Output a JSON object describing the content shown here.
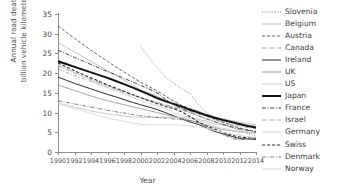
{
  "chart_data": {
    "type": "line",
    "title": "",
    "xlabel": "Year",
    "ylabel": "Annual road deaths per billion vehicle kilometers travelled",
    "ylabel_line1": "Annual road deaths per",
    "ylabel_line2": "billion vehicle kilometers travelled",
    "xlim": [
      1990,
      2014
    ],
    "ylim": [
      0,
      35
    ],
    "xticks": [
      1990,
      1992,
      1994,
      1996,
      1998,
      2000,
      2002,
      2004,
      2006,
      2008,
      2010,
      2012,
      2014
    ],
    "yticks": [
      0,
      5,
      10,
      15,
      20,
      25,
      30,
      35
    ],
    "grid": false,
    "legend_position": "right",
    "x": [
      1990,
      1991,
      1992,
      1993,
      1994,
      1995,
      1996,
      1997,
      1998,
      1999,
      2000,
      2001,
      2002,
      2003,
      2004,
      2005,
      2006,
      2007,
      2008,
      2009,
      2010,
      2011,
      2012,
      2013,
      2014
    ],
    "series": [
      {
        "name": "Slovenia",
        "style": "dotted",
        "width": 0.8,
        "color": "#6e6e6e",
        "x": [
          2000,
          2001,
          2002,
          2003,
          2004,
          2005,
          2006,
          2007,
          2008,
          2009,
          2010,
          2011,
          2012,
          2013,
          2014
        ],
        "values": [
          26.9,
          24.0,
          21.5,
          19.0,
          17.5,
          16.0,
          14.9,
          12.0,
          10.0,
          8.6,
          7.2,
          6.3,
          5.6,
          4.6,
          4.0
        ]
      },
      {
        "name": "Belgium",
        "style": "solid",
        "width": 0.8,
        "color": "#b5b5b5",
        "values": [
          27.8,
          26.6,
          25.4,
          24.2,
          23.0,
          21.8,
          20.6,
          19.4,
          18.2,
          17.0,
          15.8,
          15.0,
          14.2,
          13.0,
          12.0,
          11.5,
          11.0,
          10.4,
          9.6,
          8.8,
          8.4,
          8.0,
          7.6,
          7.2,
          7.0
        ]
      },
      {
        "name": "Austria",
        "style": "dashed",
        "width": 0.9,
        "color": "#4f4f4f",
        "values": [
          32.0,
          30.4,
          28.8,
          27.3,
          25.8,
          24.4,
          23.0,
          21.6,
          20.3,
          19.0,
          17.7,
          16.6,
          15.5,
          14.2,
          12.9,
          11.8,
          11.0,
          10.0,
          9.2,
          8.3,
          7.6,
          6.8,
          6.1,
          5.6,
          5.2
        ]
      },
      {
        "name": "Canada",
        "style": "dashdotted",
        "width": 0.8,
        "color": "#8a8a8a",
        "values": [
          21.8,
          20.9,
          20.0,
          19.2,
          18.4,
          17.6,
          16.8,
          16.0,
          15.3,
          14.5,
          13.8,
          13.2,
          12.6,
          12.0,
          11.4,
          10.9,
          10.3,
          9.7,
          9.0,
          8.2,
          7.6,
          7.0,
          6.6,
          6.2,
          5.9
        ]
      },
      {
        "name": "Ireland",
        "style": "solid",
        "width": 1.0,
        "color": "#2b2b2b",
        "values": [
          19.0,
          18.2,
          17.4,
          16.7,
          16.0,
          15.3,
          14.6,
          14.0,
          13.3,
          12.6,
          12.0,
          11.4,
          10.8,
          10.0,
          9.2,
          8.4,
          7.6,
          7.0,
          6.1,
          5.2,
          4.6,
          4.0,
          3.4,
          3.3,
          3.2
        ]
      },
      {
        "name": "UK",
        "style": "solid",
        "width": 0.8,
        "color": "#8f8f8f",
        "values": [
          17.0,
          16.3,
          15.6,
          14.9,
          14.2,
          13.6,
          13.0,
          12.5,
          12.0,
          11.5,
          11.0,
          10.5,
          10.0,
          9.5,
          9.0,
          8.5,
          8.0,
          7.5,
          6.9,
          6.2,
          5.7,
          5.4,
          5.1,
          4.9,
          4.8
        ]
      },
      {
        "name": "US",
        "style": "solid",
        "width": 0.9,
        "color": "#c4c4c4",
        "values": [
          12.4,
          11.9,
          11.4,
          10.9,
          10.4,
          10.0,
          9.7,
          9.4,
          9.1,
          8.9,
          8.8,
          8.8,
          8.8,
          8.8,
          8.8,
          8.8,
          8.6,
          8.3,
          7.8,
          7.1,
          6.9,
          6.8,
          6.9,
          6.8,
          6.8
        ]
      },
      {
        "name": "Japan",
        "style": "solid",
        "width": 2.0,
        "color": "#111111",
        "values": [
          23.0,
          22.3,
          21.6,
          20.9,
          20.2,
          19.5,
          18.8,
          18.0,
          17.2,
          16.4,
          15.5,
          14.6,
          13.7,
          12.9,
          12.2,
          11.5,
          10.7,
          10.0,
          9.3,
          8.7,
          8.1,
          7.6,
          7.1,
          6.6,
          6.2
        ]
      },
      {
        "name": "France",
        "style": "dashdotted",
        "width": 1.0,
        "color": "#3f3f3f",
        "values": [
          25.8,
          24.9,
          24.0,
          23.1,
          22.2,
          21.3,
          20.4,
          19.6,
          18.7,
          17.8,
          16.9,
          16.0,
          15.0,
          13.4,
          12.0,
          11.0,
          10.0,
          9.2,
          8.4,
          7.7,
          7.0,
          6.4,
          5.9,
          5.5,
          5.2
        ]
      },
      {
        "name": "Israel",
        "style": "dashdotted",
        "width": 0.8,
        "color": "#9a9a9a",
        "values": [
          21.0,
          20.2,
          19.4,
          18.6,
          17.9,
          17.1,
          16.4,
          15.7,
          15.0,
          14.4,
          13.8,
          13.1,
          12.5,
          11.9,
          11.2,
          10.6,
          10.0,
          9.2,
          8.4,
          7.6,
          6.9,
          6.2,
          5.6,
          5.2,
          4.9
        ]
      },
      {
        "name": "Germany",
        "style": "solid",
        "width": 0.8,
        "color": "#cdcdcd",
        "values": [
          22.2,
          21.2,
          20.2,
          19.2,
          18.2,
          17.3,
          16.4,
          15.5,
          14.7,
          13.9,
          13.1,
          12.4,
          11.7,
          11.0,
          10.0,
          9.3,
          8.7,
          8.1,
          7.4,
          6.6,
          6.0,
          5.6,
          5.2,
          4.9,
          4.6
        ]
      },
      {
        "name": "Swiss",
        "style": "dashed",
        "width": 1.1,
        "color": "#2f2f2f",
        "values": [
          22.6,
          21.6,
          20.6,
          19.7,
          18.8,
          17.9,
          17.0,
          16.2,
          15.4,
          14.6,
          13.8,
          13.0,
          12.3,
          11.6,
          11.0,
          10.2,
          9.0,
          7.6,
          6.6,
          5.8,
          5.0,
          4.3,
          3.8,
          3.6,
          3.5
        ]
      },
      {
        "name": "Denmark",
        "style": "dashdotted",
        "width": 0.9,
        "color": "#707070",
        "values": [
          13.0,
          12.6,
          12.2,
          11.8,
          11.4,
          11.0,
          10.6,
          10.2,
          9.9,
          9.5,
          9.2,
          9.0,
          8.8,
          8.6,
          8.4,
          8.2,
          8.0,
          7.4,
          6.4,
          5.4,
          4.4,
          3.6,
          3.0,
          3.4,
          3.8
        ]
      },
      {
        "name": "Norway",
        "style": "solid",
        "width": 0.9,
        "color": "#d8d8d8",
        "values": [
          12.2,
          11.6,
          11.0,
          10.4,
          9.8,
          9.2,
          8.6,
          8.2,
          7.8,
          7.4,
          7.0,
          6.9,
          6.9,
          6.9,
          6.9,
          6.8,
          6.6,
          6.4,
          6.0,
          5.5,
          5.0,
          4.6,
          4.2,
          3.9,
          3.7
        ]
      }
    ]
  }
}
